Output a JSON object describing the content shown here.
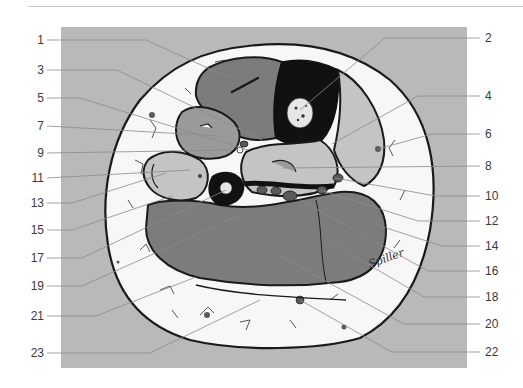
{
  "figure": {
    "colors": {
      "background_panel": "#b9b9b9",
      "skin_subcutis": "#f7f7f7",
      "muscle_dark": "#7c7c7c",
      "muscle_mid": "#9a9a9a",
      "muscle_light": "#c4c4c4",
      "bone_cortex": "#111111",
      "bone_marrow": "#e6e6e6",
      "outline": "#1a1a1a",
      "leader_line": "#8a8a8a",
      "label_text": "#3a3a3a"
    },
    "signature": "Spiller",
    "labels_left": [
      {
        "id": "1",
        "text": "1"
      },
      {
        "id": "3",
        "text": "3"
      },
      {
        "id": "5",
        "text": "5"
      },
      {
        "id": "7",
        "text": "7"
      },
      {
        "id": "9",
        "text": "9"
      },
      {
        "id": "11",
        "text": "11"
      },
      {
        "id": "13",
        "text": "13"
      },
      {
        "id": "15",
        "text": "15"
      },
      {
        "id": "17",
        "text": "17"
      },
      {
        "id": "19",
        "text": "19"
      },
      {
        "id": "21",
        "text": "21"
      },
      {
        "id": "23",
        "text": "23"
      }
    ],
    "labels_right": [
      {
        "id": "2",
        "text": "2"
      },
      {
        "id": "4",
        "text": "4"
      },
      {
        "id": "6",
        "text": "6"
      },
      {
        "id": "8",
        "text": "8"
      },
      {
        "id": "10",
        "text": "10"
      },
      {
        "id": "12",
        "text": "12"
      },
      {
        "id": "14",
        "text": "14"
      },
      {
        "id": "16",
        "text": "16"
      },
      {
        "id": "18",
        "text": "18"
      },
      {
        "id": "20",
        "text": "20"
      },
      {
        "id": "22",
        "text": "22"
      }
    ]
  }
}
